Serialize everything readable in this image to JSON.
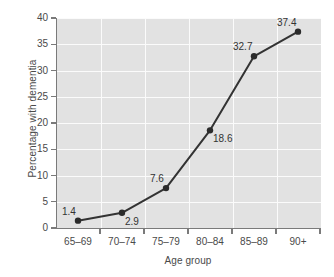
{
  "chart_data": {
    "type": "line",
    "title": "",
    "xlabel": "Age group",
    "ylabel": "Percentage with dementia",
    "categories": [
      "65–69",
      "70–74",
      "75–79",
      "80–84",
      "85–89",
      "90+"
    ],
    "values": [
      1.4,
      2.9,
      7.6,
      18.6,
      32.7,
      37.4
    ],
    "point_labels": [
      "1.4",
      "2.9",
      "7.6",
      "18.6",
      "32.7",
      "37.4"
    ],
    "label_positions": [
      "above-left",
      "below-right",
      "above-left",
      "below-right",
      "above-left",
      "above-left"
    ],
    "ylim": [
      0,
      40
    ],
    "ytick_labels": [
      "0",
      "5",
      "10",
      "15",
      "20",
      "25",
      "30",
      "35",
      "40"
    ],
    "ytick_values": [
      0,
      5,
      10,
      15,
      20,
      25,
      30,
      35,
      40
    ],
    "grid": true,
    "legend": "none",
    "marker": "filled-circle",
    "colors": {
      "line": "#333333",
      "marker": "#2b2b2b",
      "plot_background": "#e2e2e2",
      "gridline": "#fbfbfb",
      "axis": "#7a7a7a",
      "text": "#4a4a4a",
      "page_background": "#ffffff"
    }
  }
}
